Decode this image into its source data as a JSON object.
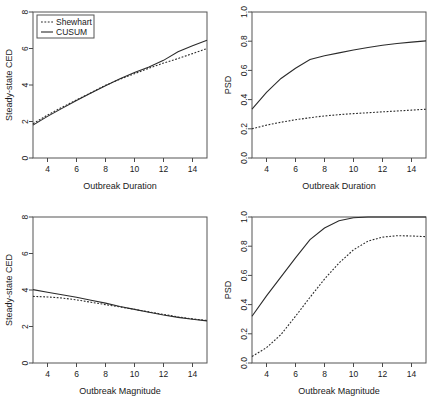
{
  "figure": {
    "legend": {
      "entries": [
        {
          "label": "Shewhart",
          "style": "dotted"
        },
        {
          "label": "CUSUM",
          "style": "solid"
        }
      ]
    }
  },
  "chart_data": [
    {
      "type": "line",
      "panel": "top-left",
      "title": "",
      "xlabel": "Outbreak Duration",
      "ylabel": "Steady-state CED",
      "xlim": [
        3,
        15
      ],
      "ylim": [
        0,
        8
      ],
      "xticks": [
        4,
        6,
        8,
        10,
        12,
        14
      ],
      "yticks": [
        0,
        2,
        4,
        6,
        8
      ],
      "grid": false,
      "legend_position": "top-left",
      "x": [
        3,
        4,
        5,
        6,
        7,
        8,
        9,
        10,
        11,
        12,
        13,
        14,
        15
      ],
      "series": [
        {
          "name": "Shewhart",
          "style": "dotted",
          "values": [
            1.88,
            2.35,
            2.78,
            3.18,
            3.58,
            3.98,
            4.32,
            4.62,
            4.92,
            5.2,
            5.45,
            5.72,
            6.0
          ]
        },
        {
          "name": "CUSUM",
          "style": "solid",
          "values": [
            1.8,
            2.28,
            2.72,
            3.15,
            3.56,
            3.96,
            4.34,
            4.68,
            4.98,
            5.35,
            5.82,
            6.15,
            6.45
          ]
        }
      ]
    },
    {
      "type": "line",
      "panel": "top-right",
      "title": "",
      "xlabel": "Outbreak Duration",
      "ylabel": "PSD",
      "xlim": [
        3,
        15
      ],
      "ylim": [
        0.0,
        1.0
      ],
      "xticks": [
        4,
        6,
        8,
        10,
        12,
        14
      ],
      "yticks": [
        0.0,
        0.2,
        0.4,
        0.6,
        0.8,
        1.0
      ],
      "grid": false,
      "legend_position": "none",
      "x": [
        3,
        4,
        5,
        6,
        7,
        8,
        9,
        10,
        11,
        12,
        13,
        14,
        15
      ],
      "series": [
        {
          "name": "Shewhart",
          "style": "dotted",
          "values": [
            0.2,
            0.225,
            0.245,
            0.262,
            0.276,
            0.288,
            0.297,
            0.304,
            0.31,
            0.316,
            0.322,
            0.328,
            0.334
          ]
        },
        {
          "name": "CUSUM",
          "style": "solid",
          "values": [
            0.335,
            0.45,
            0.545,
            0.615,
            0.675,
            0.7,
            0.72,
            0.74,
            0.757,
            0.772,
            0.784,
            0.794,
            0.802
          ]
        }
      ]
    },
    {
      "type": "line",
      "panel": "bottom-left",
      "title": "",
      "xlabel": "Outbreak Magnitude",
      "ylabel": "Steady-state CED",
      "xlim": [
        3,
        15
      ],
      "ylim": [
        0,
        8
      ],
      "xticks": [
        4,
        6,
        8,
        10,
        12,
        14
      ],
      "yticks": [
        0,
        2,
        4,
        6,
        8
      ],
      "grid": false,
      "legend_position": "none",
      "x": [
        3,
        4,
        5,
        6,
        7,
        8,
        9,
        10,
        11,
        12,
        13,
        14,
        15
      ],
      "series": [
        {
          "name": "Shewhart",
          "style": "dotted",
          "values": [
            3.65,
            3.62,
            3.56,
            3.46,
            3.33,
            3.2,
            3.07,
            2.94,
            2.8,
            2.66,
            2.53,
            2.42,
            2.33
          ]
        },
        {
          "name": "CUSUM",
          "style": "solid",
          "values": [
            4.02,
            3.88,
            3.74,
            3.6,
            3.44,
            3.28,
            3.1,
            2.94,
            2.78,
            2.63,
            2.5,
            2.4,
            2.31
          ]
        }
      ]
    },
    {
      "type": "line",
      "panel": "bottom-right",
      "title": "",
      "xlabel": "Outbreak Magnitude",
      "ylabel": "PSD",
      "xlim": [
        3,
        15
      ],
      "ylim": [
        0.0,
        1.0
      ],
      "xticks": [
        4,
        6,
        8,
        10,
        12,
        14
      ],
      "yticks": [
        0.0,
        0.2,
        0.4,
        0.6,
        0.8,
        1.0
      ],
      "grid": false,
      "legend_position": "none",
      "x": [
        3,
        4,
        5,
        6,
        7,
        8,
        9,
        10,
        11,
        12,
        13,
        14,
        15
      ],
      "series": [
        {
          "name": "Shewhart",
          "style": "dotted",
          "values": [
            0.045,
            0.105,
            0.195,
            0.32,
            0.45,
            0.575,
            0.685,
            0.775,
            0.835,
            0.862,
            0.872,
            0.87,
            0.865
          ]
        },
        {
          "name": "CUSUM",
          "style": "solid",
          "values": [
            0.32,
            0.46,
            0.59,
            0.72,
            0.845,
            0.925,
            0.975,
            0.995,
            1.0,
            1.0,
            1.0,
            1.0,
            1.0
          ]
        }
      ]
    }
  ]
}
